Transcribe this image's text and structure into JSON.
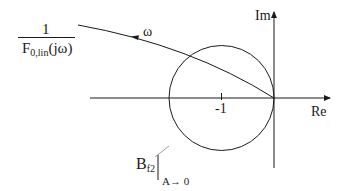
{
  "diagram": {
    "type": "nyquist-plot",
    "colors": {
      "line": "#1a1a1a",
      "background": "#ffffff",
      "leader": "#888888"
    },
    "axes": {
      "real_label": "Re",
      "imag_label": "Im"
    },
    "tick": {
      "label": "-1"
    },
    "curve": {
      "label_numerator": "1",
      "label_denominator_main": "F",
      "label_denominator_sub": "0,lin",
      "label_denominator_tail": "(jω)",
      "direction_label": "ω"
    },
    "circle": {
      "label_main": "B",
      "label_sub": "f2",
      "condition": "A→ 0"
    }
  }
}
